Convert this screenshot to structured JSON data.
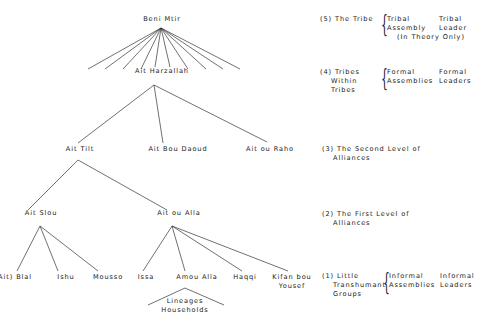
{
  "tree": {
    "root": "Beni Mtir",
    "level4": "Ait Harzallah",
    "level3": [
      "Ait Tilt",
      "Ait Bou Daoud",
      "Ait ou Raho"
    ],
    "level2": [
      "Ait Slou",
      "Ait ou Alla"
    ],
    "level1_slou": [
      "Ait) Blal",
      "Ishu",
      "Mousso"
    ],
    "level1_alla": [
      "Issa",
      "Amou Alla",
      "Haqqi",
      "Kifan bou",
      "Yousef"
    ],
    "lineages": [
      "Lineages",
      "Households"
    ]
  },
  "levels": {
    "l5": {
      "label": "(5) The Tribe",
      "col1": [
        "Tribal",
        "Assembly"
      ],
      "col2": [
        "Tribal",
        "Leader"
      ],
      "note": "(In Theory Only)"
    },
    "l4": {
      "label": [
        "(4) Tribes",
        "Within",
        "Tribes"
      ],
      "col1": [
        "Formal",
        "Assemblies"
      ],
      "col2": [
        "Formal",
        "Leaders"
      ]
    },
    "l3": {
      "label": [
        "(3) The Second Level of",
        "Alliances"
      ]
    },
    "l2": {
      "label": [
        "(2) The First Level of",
        "Alliances"
      ]
    },
    "l1": {
      "label": [
        "(1) Little",
        "Transhumant",
        "Groups"
      ],
      "col1": [
        "Informal",
        "Assemblies"
      ],
      "col2": [
        "Informal",
        "Leaders"
      ]
    }
  }
}
